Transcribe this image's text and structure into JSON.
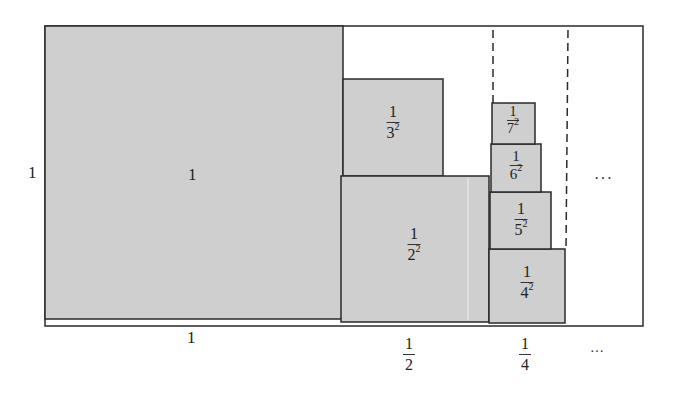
{
  "diagram": {
    "title": "",
    "colors": {
      "fill": "#cfcfcf",
      "stroke": "#2a2a2a",
      "background": "#ffffff"
    },
    "side_labels": {
      "left": "1"
    },
    "squares": [
      {
        "id": "sq1",
        "label": "1",
        "num": "1",
        "den": "",
        "exp": ""
      },
      {
        "id": "sq2",
        "label": "1/2^2",
        "num": "1",
        "den": "2",
        "exp": "2"
      },
      {
        "id": "sq3",
        "label": "1/3^2",
        "num": "1",
        "den": "3",
        "exp": "2"
      },
      {
        "id": "sq4",
        "label": "1/4^2",
        "num": "1",
        "den": "4",
        "exp": "2"
      },
      {
        "id": "sq5",
        "label": "1/5^2",
        "num": "1",
        "den": "5",
        "exp": "2"
      },
      {
        "id": "sq6",
        "label": "1/6^2",
        "num": "1",
        "den": "6",
        "exp": "2"
      },
      {
        "id": "sq7",
        "label": "1/7^2",
        "num": "1",
        "den": "7",
        "exp": "2"
      }
    ],
    "bottom_labels": [
      {
        "id": "w1",
        "num": "1",
        "den": ""
      },
      {
        "id": "w2",
        "num": "1",
        "den": "2"
      },
      {
        "id": "w3",
        "num": "1",
        "den": "4"
      },
      {
        "id": "w4",
        "text": "…"
      }
    ],
    "continuation": "···"
  }
}
